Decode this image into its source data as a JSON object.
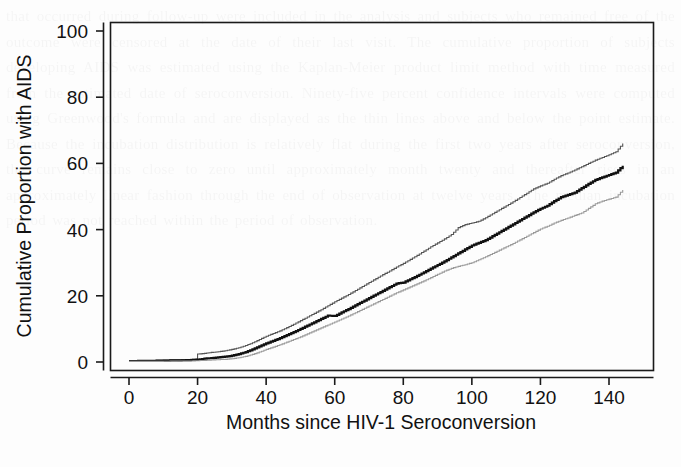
{
  "figure": {
    "background_color": "#fdfdfd",
    "ink_color": "#111111",
    "bleed_text": "that occurred during follow-up were included in the analysis and subjects who remained free of the outcome were censored at the date of their last visit. The cumulative proportion of subjects developing AIDS was estimated using the Kaplan-Meier product limit method with time measured from the estimated date of seroconversion. Ninety-five percent confidence intervals were computed using Greenwood's formula and are displayed as the thin lines above and below the point estimate. Because the incubation distribution is relatively flat during the first two years after seroconversion, the curve remains close to zero until approximately month twenty and thereafter rises in an approximately linear fashion through the end of observation at twelve years. The median incubation period was not reached within the period of observation."
  },
  "chart_data": {
    "type": "line",
    "subtype": "kaplan-meier-step",
    "title": "",
    "xlabel": "Months since HIV-1 Seroconversion",
    "ylabel": "Cumulative Proportion with AIDS",
    "xlim": [
      0,
      150
    ],
    "ylim": [
      0,
      105
    ],
    "xticks": [
      0,
      20,
      40,
      60,
      80,
      100,
      120,
      140
    ],
    "xtick_labels": [
      "0",
      "20",
      "40",
      "60",
      "80",
      "100",
      "120",
      "140"
    ],
    "yticks": [
      0,
      20,
      40,
      60,
      80,
      100
    ],
    "ytick_labels": [
      "0",
      "20",
      "40",
      "60",
      "80",
      "100"
    ],
    "grid": false,
    "legend": "none",
    "box_frame": true,
    "series": [
      {
        "name": "Upper 95% confidence limit",
        "role": "upper-ci",
        "color": "#555555",
        "line_width": 1.1,
        "x": [
          0,
          8,
          14,
          18,
          20,
          20,
          22,
          24,
          26,
          28,
          30,
          32,
          34,
          36,
          38,
          40,
          42,
          44,
          46,
          48,
          50,
          52,
          54,
          56,
          58,
          60,
          62,
          64,
          66,
          68,
          70,
          72,
          74,
          76,
          78,
          80,
          82,
          84,
          86,
          88,
          90,
          92,
          94,
          96,
          98,
          100,
          102,
          104,
          106,
          108,
          110,
          112,
          114,
          116,
          118,
          120,
          122,
          124,
          126,
          128,
          130,
          132,
          134,
          136,
          138,
          140,
          142,
          144
        ],
        "y": [
          0.4,
          0.5,
          0.7,
          0.8,
          0.9,
          2.4,
          2.6,
          2.9,
          3.1,
          3.4,
          3.8,
          4.3,
          5.0,
          5.8,
          6.8,
          7.8,
          8.6,
          9.4,
          10.4,
          11.4,
          12.5,
          13.6,
          14.7,
          15.8,
          17.0,
          18.2,
          19.3,
          20.4,
          21.6,
          22.8,
          24.0,
          25.2,
          26.4,
          27.5,
          28.7,
          29.8,
          31.0,
          32.2,
          33.5,
          34.8,
          36.0,
          37.2,
          38.5,
          40.6,
          41.5,
          42.0,
          42.5,
          43.6,
          44.8,
          46.0,
          47.2,
          48.4,
          49.7,
          51.0,
          52.3,
          53.2,
          54.0,
          55.2,
          56.3,
          57.1,
          58.0,
          59.0,
          60.0,
          61.0,
          61.8,
          62.6,
          63.5,
          66.0
        ]
      },
      {
        "name": "Cumulative proportion with AIDS (estimate)",
        "role": "estimate",
        "color": "#111111",
        "line_width": 2.2,
        "x": [
          0,
          8,
          14,
          18,
          20,
          22,
          24,
          26,
          28,
          30,
          32,
          34,
          36,
          38,
          40,
          42,
          44,
          46,
          48,
          50,
          52,
          54,
          56,
          58,
          60,
          62,
          64,
          66,
          68,
          70,
          72,
          74,
          76,
          78,
          80,
          82,
          84,
          86,
          88,
          90,
          92,
          94,
          96,
          98,
          100,
          102,
          104,
          106,
          108,
          110,
          112,
          114,
          116,
          118,
          120,
          122,
          124,
          126,
          128,
          130,
          132,
          134,
          136,
          138,
          140,
          142,
          144
        ],
        "y": [
          0.3,
          0.4,
          0.5,
          0.6,
          0.7,
          1.0,
          1.2,
          1.4,
          1.6,
          1.9,
          2.4,
          3.0,
          3.8,
          4.7,
          5.6,
          6.4,
          7.2,
          8.1,
          9.0,
          10.0,
          11.0,
          12.0,
          13.0,
          14.0,
          13.9,
          15.0,
          16.0,
          17.1,
          18.2,
          19.3,
          20.4,
          21.5,
          22.6,
          23.7,
          24.0,
          25.0,
          26.0,
          27.1,
          28.2,
          29.3,
          30.4,
          31.6,
          32.8,
          34.0,
          35.2,
          36.0,
          36.8,
          38.0,
          39.2,
          40.4,
          41.6,
          42.8,
          44.0,
          45.2,
          46.3,
          47.2,
          48.6,
          49.8,
          50.5,
          51.2,
          52.5,
          53.8,
          55.0,
          55.8,
          56.5,
          57.2,
          59.3
        ]
      },
      {
        "name": "Lower 95% confidence limit",
        "role": "lower-ci",
        "color": "#9a9a9a",
        "line_width": 1.1,
        "x": [
          0,
          8,
          14,
          18,
          20,
          22,
          24,
          26,
          28,
          30,
          32,
          34,
          36,
          38,
          40,
          42,
          44,
          46,
          48,
          50,
          52,
          54,
          56,
          58,
          60,
          62,
          64,
          66,
          68,
          70,
          72,
          74,
          76,
          78,
          80,
          82,
          84,
          86,
          88,
          90,
          92,
          94,
          96,
          98,
          100,
          102,
          104,
          106,
          108,
          110,
          112,
          114,
          116,
          118,
          120,
          122,
          124,
          126,
          128,
          130,
          132,
          134,
          136,
          138,
          140,
          142,
          144
        ],
        "y": [
          0.2,
          0.2,
          0.3,
          0.3,
          0.4,
          0.5,
          0.6,
          0.7,
          0.8,
          1.0,
          1.3,
          1.7,
          2.3,
          3.0,
          3.8,
          4.5,
          5.2,
          6.0,
          6.8,
          7.6,
          8.5,
          9.4,
          10.3,
          11.2,
          12.1,
          13.0,
          13.9,
          14.9,
          15.9,
          16.9,
          17.9,
          18.9,
          19.9,
          20.9,
          21.8,
          22.7,
          23.6,
          24.5,
          25.5,
          26.5,
          27.5,
          28.3,
          28.9,
          29.4,
          30.0,
          30.9,
          31.8,
          32.8,
          33.8,
          34.8,
          35.8,
          36.9,
          38.0,
          39.1,
          40.2,
          41.0,
          42.0,
          42.8,
          43.5,
          44.3,
          45.0,
          46.4,
          47.8,
          48.6,
          49.2,
          49.8,
          52.0
        ]
      }
    ]
  }
}
